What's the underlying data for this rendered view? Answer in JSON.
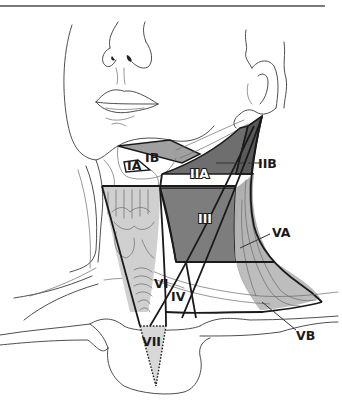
{
  "figure": {
    "type": "anatomical-diagram",
    "colors": {
      "level_I": "#9a9a9a",
      "level_II": "#6b6b6b",
      "level_III": "#7a7a7a",
      "level_IV": "#ffffff",
      "level_V": "#b4b4b4",
      "level_VI": "#d2d2d2",
      "level_VII": "#d8d8d8",
      "outline": "#1a1a1a"
    }
  },
  "labels": {
    "IA": "IA",
    "IB": "IB",
    "IIA": "IIA",
    "IIB": "IIB",
    "III": "III",
    "IV": "IV",
    "VA": "VA",
    "VB": "VB",
    "VI": "VI",
    "VII": "VII"
  }
}
